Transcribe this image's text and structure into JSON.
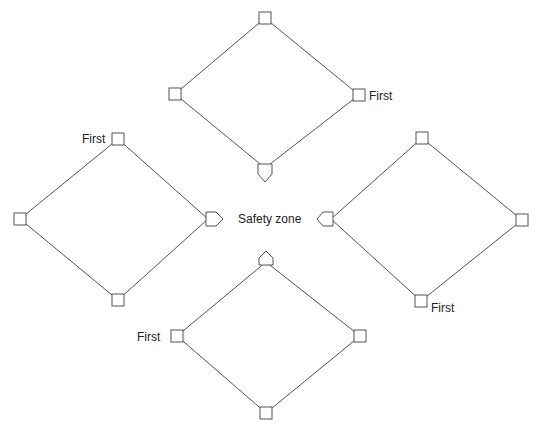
{
  "center_label": "Safety zone",
  "diamonds": [
    {
      "id": "top",
      "home_direction": "down",
      "first_label": "First",
      "bases": {
        "top": [
          265,
          18
        ],
        "left": [
          175,
          94
        ],
        "right": [
          359,
          95
        ],
        "home": [
          265,
          172
        ]
      }
    },
    {
      "id": "left",
      "home_direction": "right",
      "first_label": "First",
      "bases": {
        "top": [
          118,
          139
        ],
        "left": [
          20,
          219
        ],
        "bottom": [
          118,
          300
        ],
        "home": [
          213,
          219
        ]
      }
    },
    {
      "id": "right",
      "home_direction": "left",
      "first_label": "First",
      "bases": {
        "top": [
          422,
          138
        ],
        "right": [
          522,
          220
        ],
        "bottom": [
          421,
          301
        ],
        "home": [
          326,
          219
        ]
      }
    },
    {
      "id": "bottom",
      "home_direction": "up",
      "first_label": "First",
      "bases": {
        "home": [
          266,
          259
        ],
        "left": [
          177,
          336
        ],
        "right": [
          360,
          336
        ],
        "bottom": [
          266,
          413
        ]
      }
    }
  ],
  "colors": {
    "line": "#555555",
    "text": "#222222",
    "background": "#ffffff"
  }
}
